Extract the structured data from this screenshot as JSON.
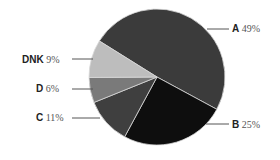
{
  "chart_data": {
    "type": "pie",
    "title": "",
    "categories": [
      "A",
      "B",
      "C",
      "D",
      "DNK"
    ],
    "values": [
      49,
      25,
      11,
      6,
      9
    ],
    "labels": [
      "A 49%",
      "B 25%",
      "C 11%",
      "D 6%",
      "DNK 9%"
    ],
    "colors": [
      "#3b3b3b",
      "#0e0e0e",
      "#3f3f3f",
      "#7a7a7a",
      "#bdbdbd"
    ],
    "legend": "none",
    "start_angle_deg": -148,
    "direction": "clockwise"
  },
  "labels": {
    "A": {
      "name": "A",
      "pct": "49%"
    },
    "B": {
      "name": "B",
      "pct": "25%"
    },
    "C": {
      "name": "C",
      "pct": "11%"
    },
    "D": {
      "name": "D",
      "pct": "6%"
    },
    "DNK": {
      "name": "DNK",
      "pct": "9%"
    }
  }
}
